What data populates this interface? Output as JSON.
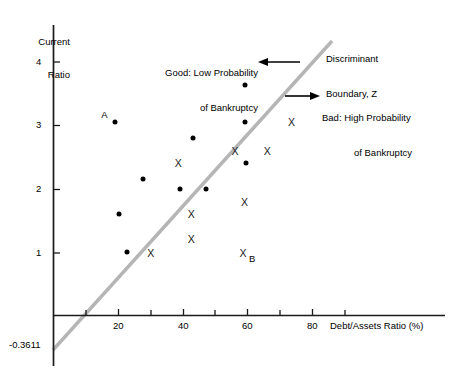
{
  "chart_data": {
    "type": "scatter",
    "title": "",
    "xlabel": "Debt/Assets Ratio (%)",
    "ylabel": "Current\nRatio",
    "ylabel_line1": "Current",
    "ylabel_line2": "Ratio",
    "xlim": [
      -2,
      96
    ],
    "ylim": [
      -0.45,
      4.45
    ],
    "xticks": [
      10,
      20,
      30,
      40,
      50,
      60,
      70,
      80,
      90
    ],
    "xtick_labels": [
      "",
      "20",
      "",
      "40",
      "",
      "60",
      "",
      "80",
      ""
    ],
    "yticks": [
      1,
      2,
      3,
      4
    ],
    "ytick_labels": [
      "1",
      "2",
      "3",
      "4"
    ],
    "y_axis_bottom_label": "-0.3611",
    "grid": false,
    "legend": "none",
    "series": [
      {
        "name": "Good: Low Probability of Bankruptcy",
        "marker": "dot",
        "points": [
          {
            "x": 19.0,
            "y": 3.05,
            "label": "A"
          },
          {
            "x": 59.0,
            "y": 3.64,
            "label": ""
          },
          {
            "x": 59.0,
            "y": 3.05,
            "label": ""
          },
          {
            "x": 43.0,
            "y": 2.8,
            "label": ""
          },
          {
            "x": 59.5,
            "y": 2.42,
            "label": ""
          },
          {
            "x": 27.5,
            "y": 2.17,
            "label": ""
          },
          {
            "x": 39.0,
            "y": 2.0,
            "label": ""
          },
          {
            "x": 47.0,
            "y": 2.0,
            "label": ""
          },
          {
            "x": 20.0,
            "y": 1.62,
            "label": ""
          },
          {
            "x": 22.5,
            "y": 1.02,
            "label": ""
          }
        ]
      },
      {
        "name": "Bad: High Probability of Bankruptcy",
        "marker": "x",
        "points": [
          {
            "x": 73.5,
            "y": 3.05,
            "label": ""
          },
          {
            "x": 56.0,
            "y": 2.6,
            "label": ""
          },
          {
            "x": 66.0,
            "y": 2.6,
            "label": ""
          },
          {
            "x": 38.5,
            "y": 2.42,
            "label": ""
          },
          {
            "x": 59.0,
            "y": 1.8,
            "label": ""
          },
          {
            "x": 42.5,
            "y": 1.62,
            "label": ""
          },
          {
            "x": 42.5,
            "y": 1.22,
            "label": ""
          },
          {
            "x": 30.0,
            "y": 1.0,
            "label": ""
          },
          {
            "x": 58.5,
            "y": 1.0,
            "label": "B"
          }
        ]
      }
    ],
    "discriminant_line": {
      "label": "Discriminant Boundary, Z",
      "color": "#b3b3b3",
      "x_intercept": 8.0,
      "y_intercept": -0.3611,
      "from": {
        "x": 4.0,
        "y": -0.47
      },
      "to": {
        "x": 86.0,
        "y": 4.35
      }
    },
    "annotations": [
      {
        "name": "good-annotation",
        "line1": "Good: Low Probability",
        "line2": "of Bankruptcy",
        "arrow": "left"
      },
      {
        "name": "bad-annotation",
        "line1": "Bad: High Probability",
        "line2": "of Bankruptcy",
        "arrow": "right"
      },
      {
        "name": "discriminant-annotation",
        "line1": "Discriminant",
        "line2": "Boundary, Z",
        "arrow": "none"
      }
    ],
    "colors": {
      "axis": "#1a1a1a",
      "marker": "#000000",
      "boundary": "#b3b3b3",
      "background": "#ffffff"
    }
  }
}
